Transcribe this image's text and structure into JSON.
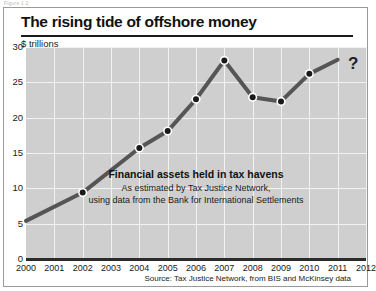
{
  "figure_caption": "Figure 1.2",
  "chart_card": {
    "title": "The rising tide of offshore money",
    "unit_label": "$ trillions",
    "question_mark": "?",
    "source": "Source: Tax Justice Network, from BIS and McKinsey data",
    "annotation": {
      "headline": "Financial assets held in tax havens",
      "sub_line_1": "As estimated by Tax Justice Network,",
      "sub_line_2": "using data from the Bank for International Settlements"
    }
  },
  "colors": {
    "plot_background": "#cfcfcf",
    "gridline": "#f2f2f2",
    "series_line": "#555555",
    "marker_fill": "#1a1a1a",
    "marker_ring": "#ffffff",
    "axis": "#2b2b2b",
    "text": "#1a1a1a",
    "card_border": "#9a9a9a"
  },
  "chart_data": {
    "type": "line",
    "title": "The rising tide of offshore money",
    "xlabel": "",
    "ylabel": "$ trillions",
    "xlim": [
      2000,
      2012
    ],
    "ylim": [
      0,
      30
    ],
    "grid": true,
    "legend": "none",
    "x_tick_labels": [
      "2000",
      "2001",
      "2002",
      "2003",
      "2004",
      "2005",
      "2006",
      "2007",
      "2008",
      "2009",
      "2010",
      "2011",
      "2012"
    ],
    "y_tick_labels": [
      "0",
      "5",
      "10",
      "15",
      "20",
      "25",
      "30"
    ],
    "y_ticks": [
      0,
      5,
      10,
      15,
      20,
      25,
      30
    ],
    "series": [
      {
        "name": "Financial assets held in tax havens",
        "x": [
          2000,
          2002,
          2004,
          2005,
          2006,
          2007,
          2008,
          2009,
          2010,
          2011
        ],
        "values": [
          5.4,
          9.4,
          15.7,
          18.1,
          22.6,
          28.1,
          22.9,
          22.3,
          26.2,
          28.2
        ],
        "markers_shown": [
          false,
          true,
          true,
          true,
          true,
          true,
          true,
          true,
          true,
          false
        ]
      }
    ],
    "annotations": [
      {
        "text": "?",
        "x": 2011.75,
        "y": 29.2
      },
      {
        "text": "Financial assets held in tax havens",
        "x": 2006.9,
        "y": 12.9
      },
      {
        "text": "As estimated by Tax Justice Network,",
        "x": 2006.9,
        "y": 11.2
      },
      {
        "text": "using data from the Bank for International Settlements",
        "x": 2006.9,
        "y": 9.8
      }
    ]
  }
}
